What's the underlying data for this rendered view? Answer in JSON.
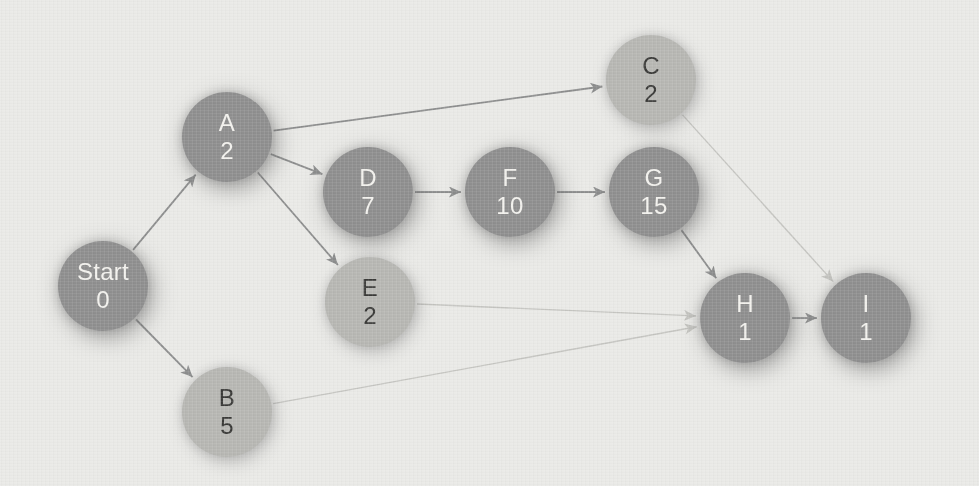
{
  "colors": {
    "background": "#eaeae7",
    "node_dark": "#8f8f8f",
    "node_light": "#b7b7b3",
    "text_on_dark": "#f3f2ee",
    "text_on_light": "#3a3a38",
    "edge_dark": "#8d8e8e",
    "edge_light": "#c5c5c1"
  },
  "graph": {
    "node_radius": 45,
    "nodes": [
      {
        "id": "Start",
        "label": "Start",
        "value": "0",
        "x": 103,
        "y": 286,
        "variant": "dark"
      },
      {
        "id": "A",
        "label": "A",
        "value": "2",
        "x": 227,
        "y": 137,
        "variant": "dark"
      },
      {
        "id": "B",
        "label": "B",
        "value": "5",
        "x": 227,
        "y": 412,
        "variant": "light"
      },
      {
        "id": "C",
        "label": "C",
        "value": "2",
        "x": 651,
        "y": 80,
        "variant": "light"
      },
      {
        "id": "D",
        "label": "D",
        "value": "7",
        "x": 368,
        "y": 192,
        "variant": "dark"
      },
      {
        "id": "E",
        "label": "E",
        "value": "2",
        "x": 370,
        "y": 302,
        "variant": "light"
      },
      {
        "id": "F",
        "label": "F",
        "value": "10",
        "x": 510,
        "y": 192,
        "variant": "dark"
      },
      {
        "id": "G",
        "label": "G",
        "value": "15",
        "x": 654,
        "y": 192,
        "variant": "dark"
      },
      {
        "id": "H",
        "label": "H",
        "value": "1",
        "x": 745,
        "y": 318,
        "variant": "dark"
      },
      {
        "id": "I",
        "label": "I",
        "value": "1",
        "x": 866,
        "y": 318,
        "variant": "dark"
      }
    ],
    "edges": [
      {
        "from": "Start",
        "to": "A",
        "variant": "dark"
      },
      {
        "from": "Start",
        "to": "B",
        "variant": "dark"
      },
      {
        "from": "A",
        "to": "C",
        "variant": "dark"
      },
      {
        "from": "A",
        "to": "D",
        "variant": "dark"
      },
      {
        "from": "A",
        "to": "E",
        "variant": "dark"
      },
      {
        "from": "D",
        "to": "F",
        "variant": "dark"
      },
      {
        "from": "F",
        "to": "G",
        "variant": "dark"
      },
      {
        "from": "G",
        "to": "H",
        "variant": "dark"
      },
      {
        "from": "H",
        "to": "I",
        "variant": "dark"
      },
      {
        "from": "C",
        "to": "I",
        "variant": "light"
      },
      {
        "from": "E",
        "to": "H",
        "variant": "light"
      },
      {
        "from": "B",
        "to": "H",
        "variant": "light"
      }
    ]
  }
}
